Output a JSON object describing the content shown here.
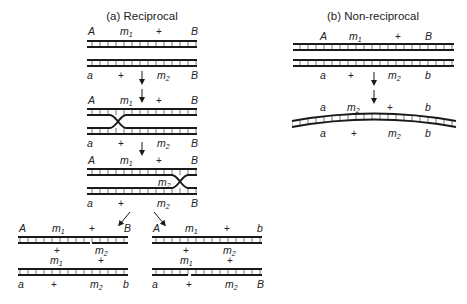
{
  "panels": {
    "reciprocal": {
      "title": "(a) Reciprocal",
      "stages": [
        {
          "name": "parental",
          "top_labels": [
            "A",
            "m1",
            "+",
            "B"
          ],
          "bottom_labels": [
            "a",
            "+",
            "m2",
            "B"
          ]
        },
        {
          "name": "first-crossover",
          "top_labels": [
            "A",
            "m1",
            "+",
            "B"
          ],
          "bottom_labels": [
            "a",
            "+",
            "m2",
            "B"
          ]
        },
        {
          "name": "second-crossover",
          "top_labels": [
            "A",
            "m1",
            "+",
            "B"
          ],
          "inner_label": "m2",
          "bottom_labels": [
            "a",
            "+",
            "m2",
            "B"
          ]
        }
      ],
      "products": [
        {
          "name": "product-left",
          "top_labels": [
            "A",
            "m1",
            "+",
            "B"
          ],
          "mid_top_labels": [
            "+",
            "m2"
          ],
          "mid_bottom_labels": [
            "m1",
            "+"
          ],
          "bottom_labels": [
            "a",
            "+",
            "m2",
            "b"
          ]
        },
        {
          "name": "product-right",
          "top_labels": [
            "A",
            "m1",
            "+",
            "b"
          ],
          "mid_top_labels": [
            "+",
            "m2"
          ],
          "mid_bottom_labels": [
            "m1",
            "+"
          ],
          "bottom_labels": [
            "a",
            "+",
            "m2",
            "B"
          ]
        }
      ]
    },
    "non_reciprocal": {
      "title": "(b) Non-reciprocal",
      "parental": {
        "top_labels": [
          "A",
          "m1",
          "+",
          "B"
        ],
        "bottom_labels": [
          "a",
          "+",
          "m2",
          "b"
        ]
      },
      "product": {
        "top_labels": [
          "a",
          "m2",
          "+",
          "b"
        ],
        "bottom_labels": [
          "a",
          "+",
          "m2",
          "b"
        ]
      }
    }
  },
  "glyphs": {
    "subscript_1": "1",
    "subscript_2": "2",
    "m": "m"
  }
}
